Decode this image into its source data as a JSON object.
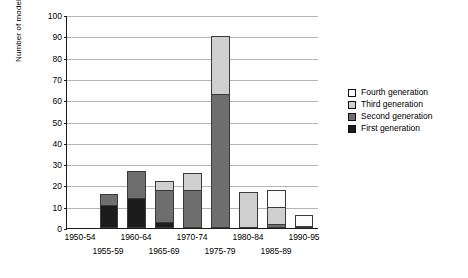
{
  "chart_data": {
    "type": "bar",
    "stacked": true,
    "title": "",
    "xlabel": "",
    "ylabel": "Number of models",
    "ylim": [
      0,
      100
    ],
    "ytick_step": 10,
    "yticks": [
      0,
      10,
      20,
      30,
      40,
      50,
      60,
      70,
      80,
      90,
      100
    ],
    "grid": "horizontal",
    "legend_position": "right-outside",
    "categories": [
      "1950-54",
      "1955-59",
      "1960-64",
      "1965-69",
      "1970-74",
      "1975-79",
      "1980-84",
      "1985-89",
      "1990-95"
    ],
    "series": [
      {
        "name": "First generation",
        "color": "#1c1c1c",
        "values": [
          0,
          11,
          14,
          3,
          0,
          0,
          0,
          0,
          0
        ]
      },
      {
        "name": "Second generation",
        "color": "#6e6e6e",
        "values": [
          0,
          5,
          13,
          15,
          18,
          63,
          0,
          2,
          0
        ]
      },
      {
        "name": "Third generation",
        "color": "#cfcfcf",
        "values": [
          0,
          0,
          0,
          4,
          8,
          27,
          17,
          8,
          1
        ]
      },
      {
        "name": "Fourth generation",
        "color": "#fbfbfb",
        "values": [
          0,
          0,
          0,
          0,
          0,
          0,
          0,
          8,
          5
        ]
      }
    ],
    "totals": [
      0,
      16,
      27,
      22,
      26,
      90,
      17,
      18,
      6
    ],
    "legend_order_displayed": [
      "Fourth generation",
      "Third generation",
      "Second generation",
      "First generation"
    ],
    "axis_color": "#1a1a1a",
    "gridline_color": "#b4b4b4"
  }
}
